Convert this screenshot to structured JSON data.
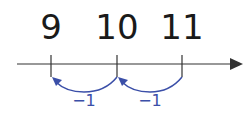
{
  "diagram": {
    "type": "number-line",
    "numbers": [
      {
        "label": "9",
        "x": 51
      },
      {
        "label": "10",
        "x": 117
      },
      {
        "label": "11",
        "x": 182
      }
    ],
    "jumps": [
      {
        "from": "11",
        "to": "10",
        "label": "−1",
        "x": 150
      },
      {
        "from": "10",
        "to": "9",
        "label": "−1",
        "x": 84
      }
    ],
    "colors": {
      "axis": "#333333",
      "jump": "#3b4fa8",
      "text": "#1a1a1a"
    }
  }
}
